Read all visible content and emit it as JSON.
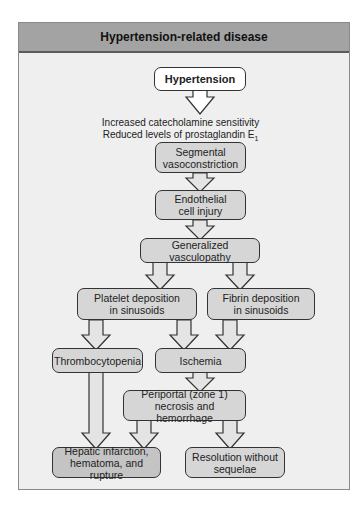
{
  "title": "Hypertension-related disease",
  "nodes": {
    "hypertension": "Hypertension",
    "note_line1": "Increased catecholamine sensitivity",
    "note_line2": "Reduced levels of prostaglandin E",
    "note_line2_sub": "1",
    "segmental_l1": "Segmental",
    "segmental_l2": "vasoconstriction",
    "endothelial_l1": "Endothelial",
    "endothelial_l2": "cell injury",
    "generalized": "Generalized vasculopathy",
    "platelet_l1": "Platelet deposition",
    "platelet_l2": "in sinusoids",
    "fibrin_l1": "Fibrin deposition",
    "fibrin_l2": "in sinusoids",
    "thrombocytopenia": "Thrombocytopenia",
    "ischemia": "Ischemia",
    "periportal_l1": "Periportal (zone 1)",
    "periportal_l2": "necrosis and hemorrhage",
    "hepatic_l1": "Hepatic infarction,",
    "hepatic_l2": "hematoma, and rupture",
    "resolution_l1": "Resolution without",
    "resolution_l2": "sequelae"
  },
  "edges": [
    [
      "hypertension",
      "segmental"
    ],
    [
      "segmental",
      "endothelial"
    ],
    [
      "endothelial",
      "generalized"
    ],
    [
      "generalized",
      "platelet"
    ],
    [
      "generalized",
      "fibrin"
    ],
    [
      "platelet",
      "thrombocytopenia"
    ],
    [
      "platelet",
      "ischemia"
    ],
    [
      "fibrin",
      "ischemia"
    ],
    [
      "ischemia",
      "periportal"
    ],
    [
      "thrombocytopenia",
      "hepatic"
    ],
    [
      "periportal",
      "hepatic"
    ],
    [
      "periportal",
      "resolution"
    ]
  ],
  "colors": {
    "header_bg": "#a3a3a3",
    "panel_bg": "#efefef",
    "box_fill": "#d6d6d6",
    "border": "#333333"
  }
}
